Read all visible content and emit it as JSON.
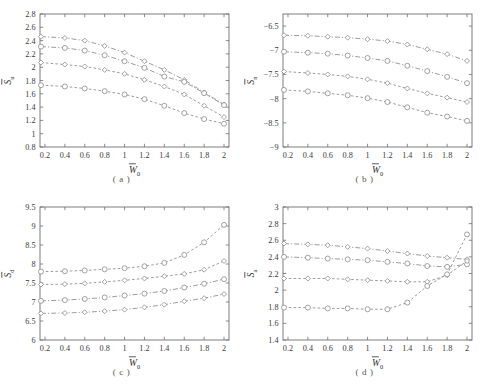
{
  "figure": {
    "subplot_count": 4,
    "marker_symbols": [
      "diamond",
      "circle",
      "diamond",
      "circle"
    ],
    "line_styles": [
      "dashdot",
      "dashdot",
      "dashed",
      "dashed"
    ],
    "series_color": "#8a8a8a",
    "axis_color": "#6f6f6f"
  },
  "chart_data": [
    {
      "type": "line",
      "panel": "a",
      "caption": "( a )",
      "title": "",
      "xlabel": "W",
      "xlabel_sub": "0",
      "xlabel_overbar": true,
      "ylabel": "S",
      "ylabel_sub": "u",
      "ylabel_overbar": true,
      "xlim": [
        0.15,
        2.05
      ],
      "ylim": [
        0.8,
        2.8
      ],
      "xticks": [
        0.2,
        0.4,
        0.6,
        0.8,
        1,
        1.2,
        1.4,
        1.6,
        1.8,
        2
      ],
      "xticklabels": [
        "0.2",
        "0.4",
        "0.6",
        "0.8",
        "1",
        "1.2",
        "1.4",
        "1.6",
        "1.8",
        "2"
      ],
      "yticks": [
        0.8,
        1,
        1.2,
        1.4,
        1.6,
        1.8,
        2,
        2.2,
        2.4,
        2.6,
        2.8
      ],
      "yticklabels": [
        "0.8",
        "1",
        "1.2",
        "1.4",
        "1.6",
        "1.8",
        "2",
        "2.2",
        "2.4",
        "2.6",
        "2.8"
      ],
      "grid": false,
      "legend": "none",
      "x": [
        0.16,
        0.4,
        0.6,
        0.8,
        1,
        1.2,
        1.4,
        1.6,
        1.8,
        2
      ],
      "series": [
        {
          "name": "series-1",
          "marker": "diamond",
          "style": "dashdot",
          "values": [
            2.46,
            2.44,
            2.4,
            2.32,
            2.22,
            2.09,
            1.96,
            1.81,
            1.62,
            1.44
          ]
        },
        {
          "name": "series-2",
          "marker": "circle",
          "style": "dashdot",
          "values": [
            2.31,
            2.29,
            2.25,
            2.18,
            2.09,
            1.99,
            1.86,
            1.78,
            1.61,
            1.43
          ]
        },
        {
          "name": "series-3",
          "marker": "diamond",
          "style": "dashed",
          "values": [
            2.07,
            2.04,
            2.01,
            1.96,
            1.9,
            1.81,
            1.71,
            1.59,
            1.42,
            1.25
          ]
        },
        {
          "name": "series-4",
          "marker": "circle",
          "style": "dashed",
          "values": [
            1.73,
            1.71,
            1.68,
            1.64,
            1.59,
            1.52,
            1.42,
            1.31,
            1.22,
            1.15
          ]
        }
      ]
    },
    {
      "type": "line",
      "panel": "b",
      "caption": "( b )",
      "title": "",
      "xlabel": "W",
      "xlabel_sub": "0",
      "xlabel_overbar": true,
      "ylabel": "S",
      "ylabel_sub": "n",
      "ylabel_overbar": true,
      "xlim": [
        0.15,
        2.05
      ],
      "ylim": [
        -9,
        -6.25
      ],
      "xticks": [
        0.2,
        0.4,
        0.6,
        0.8,
        1,
        1.2,
        1.4,
        1.6,
        1.8,
        2
      ],
      "xticklabels": [
        "0.2",
        "0.4",
        "0.6",
        "0.8",
        "1",
        "1.2",
        "1.4",
        "1.6",
        "1.8",
        "2"
      ],
      "yticks": [
        -9,
        -8.5,
        -8,
        -7.5,
        -7,
        -6.5
      ],
      "yticklabels": [
        "−9",
        "−8.5",
        "−8",
        "−7.5",
        "−7",
        "−6.5"
      ],
      "grid": false,
      "legend": "none",
      "x": [
        0.16,
        0.4,
        0.6,
        0.8,
        1,
        1.2,
        1.4,
        1.6,
        1.8,
        2
      ],
      "series": [
        {
          "name": "series-1",
          "marker": "diamond",
          "style": "dashdot",
          "values": [
            -6.69,
            -6.7,
            -6.72,
            -6.74,
            -6.77,
            -6.81,
            -6.88,
            -6.98,
            -7.08,
            -7.22
          ]
        },
        {
          "name": "series-2",
          "marker": "circle",
          "style": "dashdot",
          "values": [
            -7.03,
            -7.05,
            -7.07,
            -7.11,
            -7.16,
            -7.22,
            -7.32,
            -7.43,
            -7.55,
            -7.68
          ]
        },
        {
          "name": "series-3",
          "marker": "diamond",
          "style": "dashed",
          "values": [
            -7.44,
            -7.47,
            -7.5,
            -7.54,
            -7.6,
            -7.68,
            -7.79,
            -7.89,
            -7.98,
            -8.07
          ]
        },
        {
          "name": "series-4",
          "marker": "circle",
          "style": "dashed",
          "values": [
            -7.82,
            -7.85,
            -7.89,
            -7.93,
            -7.99,
            -8.07,
            -8.18,
            -8.29,
            -8.37,
            -8.46
          ]
        }
      ]
    },
    {
      "type": "line",
      "panel": "c",
      "caption": "( c )",
      "title": "",
      "xlabel": "W",
      "xlabel_sub": "0",
      "xlabel_overbar": true,
      "ylabel": "S",
      "ylabel_sub": "d",
      "ylabel_overbar": true,
      "xlim": [
        0.15,
        2.05
      ],
      "ylim": [
        6,
        9.5
      ],
      "xticks": [
        0.2,
        0.4,
        0.6,
        0.8,
        1,
        1.2,
        1.4,
        1.6,
        1.8,
        2
      ],
      "xticklabels": [
        "0.2",
        "0.4",
        "0.6",
        "0.8",
        "1",
        "1.2",
        "1.4",
        "1.6",
        "1.8",
        "2"
      ],
      "yticks": [
        6,
        6.5,
        7,
        7.5,
        8,
        8.5,
        9,
        9.5
      ],
      "yticklabels": [
        "6",
        "6.5",
        "7",
        "7.5",
        "8",
        "8.5",
        "9",
        "9.5"
      ],
      "grid": false,
      "legend": "none",
      "x": [
        0.16,
        0.4,
        0.6,
        0.8,
        1,
        1.2,
        1.4,
        1.6,
        1.8,
        2
      ],
      "series": [
        {
          "name": "series-1",
          "marker": "circle",
          "style": "dashed",
          "values": [
            7.8,
            7.81,
            7.83,
            7.86,
            7.89,
            7.94,
            8.03,
            8.24,
            8.57,
            9.03
          ]
        },
        {
          "name": "series-2",
          "marker": "diamond",
          "style": "dashed",
          "values": [
            7.46,
            7.47,
            7.49,
            7.53,
            7.57,
            7.62,
            7.68,
            7.74,
            7.85,
            8.08
          ]
        },
        {
          "name": "series-3",
          "marker": "circle",
          "style": "dashdot",
          "values": [
            7.03,
            7.05,
            7.08,
            7.12,
            7.17,
            7.22,
            7.29,
            7.38,
            7.48,
            7.6
          ]
        },
        {
          "name": "series-4",
          "marker": "diamond",
          "style": "dashdot",
          "values": [
            6.7,
            6.71,
            6.73,
            6.76,
            6.8,
            6.86,
            6.93,
            7.02,
            7.1,
            7.21
          ]
        }
      ]
    },
    {
      "type": "line",
      "panel": "d",
      "caption": "( d )",
      "title": "",
      "xlabel": "W",
      "xlabel_sub": "0",
      "xlabel_overbar": true,
      "ylabel": "S",
      "ylabel_sub": "a",
      "ylabel_overbar": true,
      "xlim": [
        0.15,
        2.05
      ],
      "ylim": [
        1.4,
        3
      ],
      "xticks": [
        0.2,
        0.4,
        0.6,
        0.8,
        1,
        1.2,
        1.4,
        1.6,
        1.8,
        2
      ],
      "xticklabels": [
        "0.2",
        "0.4",
        "0.6",
        "0.8",
        "1",
        "1.2",
        "1.4",
        "1.6",
        "1.8",
        "2"
      ],
      "yticks": [
        1.4,
        1.6,
        1.8,
        2,
        2.2,
        2.4,
        2.6,
        2.8,
        3
      ],
      "yticklabels": [
        "1.4",
        "1.6",
        "1.8",
        "2",
        "2.2",
        "2.4",
        "2.6",
        "2.8",
        "3"
      ],
      "grid": false,
      "legend": "none",
      "x": [
        0.16,
        0.4,
        0.6,
        0.8,
        1,
        1.2,
        1.4,
        1.6,
        1.8,
        2
      ],
      "series": [
        {
          "name": "series-1",
          "marker": "diamond",
          "style": "dashdot",
          "values": [
            2.56,
            2.55,
            2.54,
            2.52,
            2.5,
            2.47,
            2.44,
            2.41,
            2.39,
            2.37
          ]
        },
        {
          "name": "series-2",
          "marker": "circle",
          "style": "dashdot",
          "values": [
            2.4,
            2.39,
            2.38,
            2.37,
            2.36,
            2.34,
            2.32,
            2.29,
            2.28,
            2.31
          ]
        },
        {
          "name": "series-3",
          "marker": "diamond",
          "style": "dashed",
          "values": [
            2.14,
            2.14,
            2.14,
            2.13,
            2.12,
            2.11,
            2.1,
            2.1,
            2.18,
            2.35
          ]
        },
        {
          "name": "series-4",
          "marker": "circle",
          "style": "dashed",
          "values": [
            1.79,
            1.79,
            1.78,
            1.78,
            1.77,
            1.77,
            1.85,
            2.05,
            2.19,
            2.67
          ]
        }
      ]
    }
  ]
}
